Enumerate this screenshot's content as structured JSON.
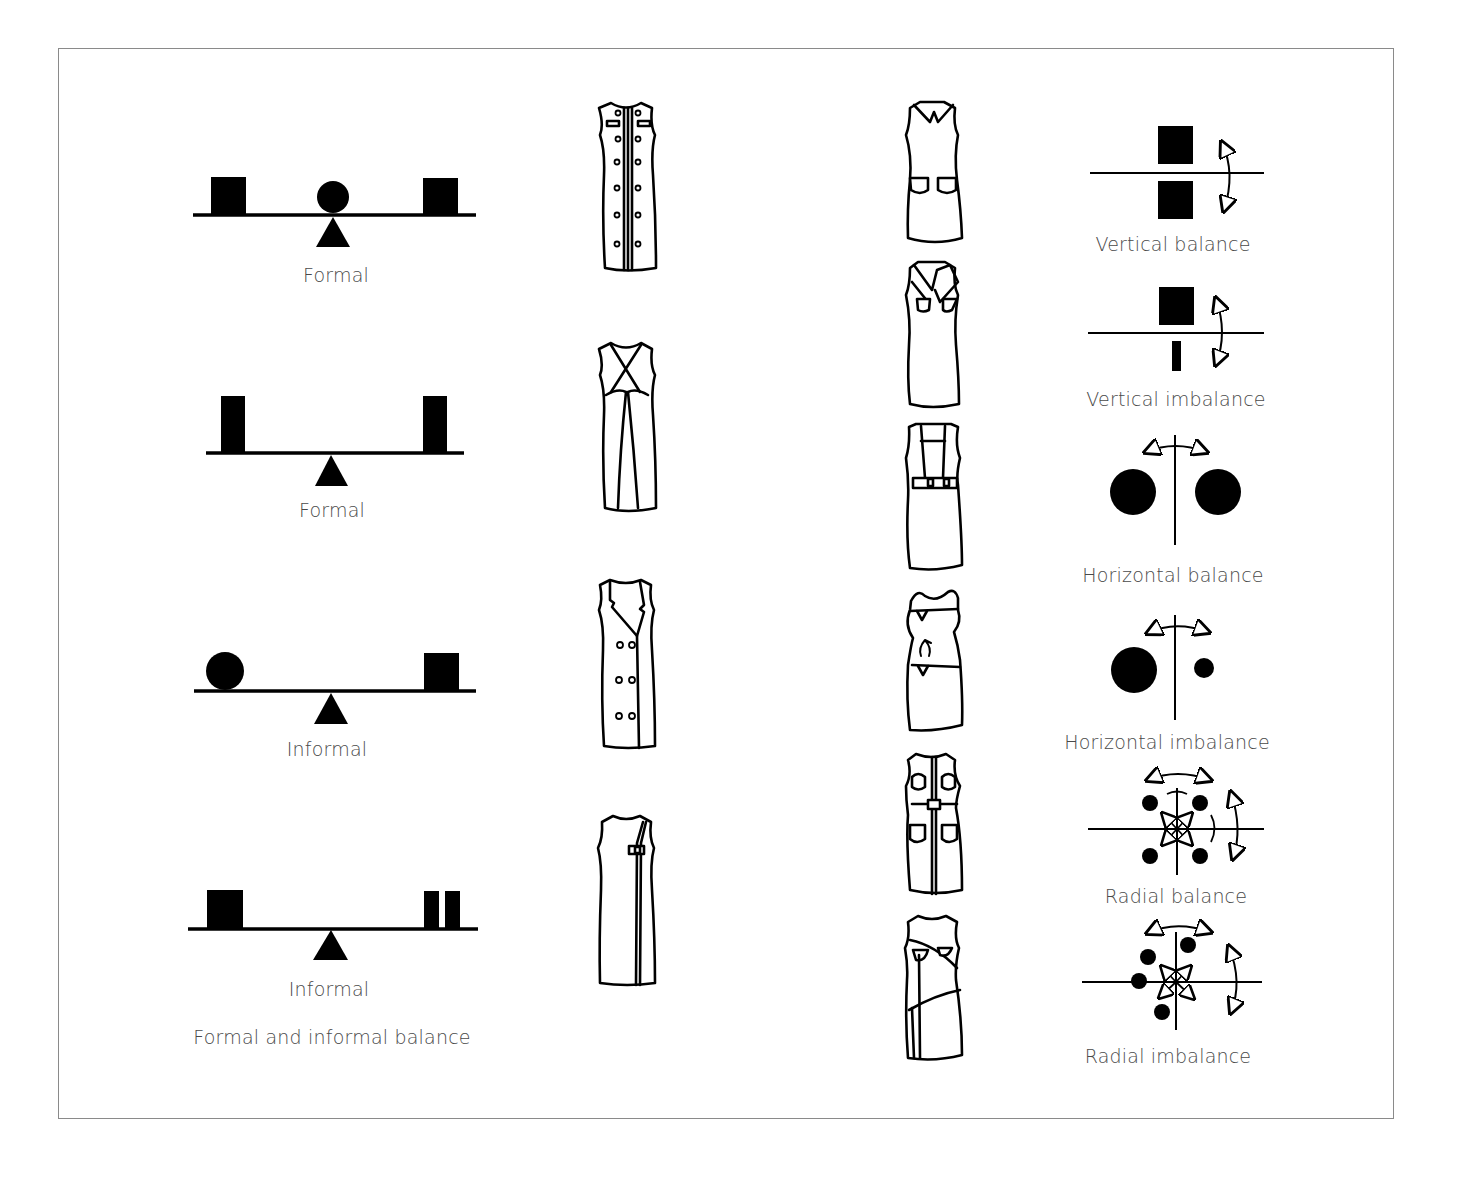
{
  "figure": {
    "title": "Formal and informal balance",
    "seesaws": [
      {
        "label": "Formal",
        "left": "square",
        "center": "circle",
        "right": "square"
      },
      {
        "label": "Formal",
        "left": "tall-rectangle",
        "right": "tall-rectangle"
      },
      {
        "label": "Informal",
        "left": "circle",
        "right": "square"
      },
      {
        "label": "Informal",
        "left": "square",
        "right": "two-narrow-rectangles"
      }
    ],
    "dresses_left_column": [
      "double-breasted-button-dress",
      "crossover-princess-seam-dress",
      "lapel-double-breasted-coat-dress",
      "asymmetric-closure-dress"
    ],
    "dresses_right_column": [
      "collar-patch-pocket-dress",
      "wide-collar-welt-pocket-dress",
      "suspender-belted-dress",
      "tie-waist-blouson-dress",
      "belted-shirt-dress",
      "asymmetric-yoke-dress"
    ],
    "balance_diagrams": [
      {
        "label": "Vertical balance",
        "type": "vertical-balance"
      },
      {
        "label": "Vertical imbalance",
        "type": "vertical-imbalance"
      },
      {
        "label": "Horizontal balance",
        "type": "horizontal-balance"
      },
      {
        "label": "Horizontal imbalance",
        "type": "horizontal-imbalance"
      },
      {
        "label": "Radial balance",
        "type": "radial-balance"
      },
      {
        "label": "Radial imbalance",
        "type": "radial-imbalance"
      }
    ]
  },
  "colors": {
    "ink": "#000000",
    "label": "#4a4a4a",
    "frame": "#8a8a8a"
  }
}
